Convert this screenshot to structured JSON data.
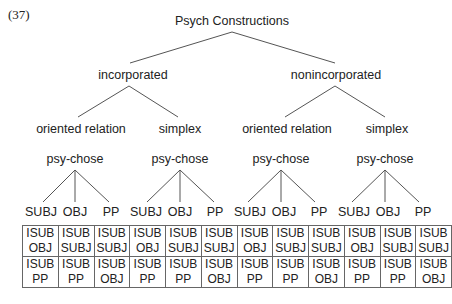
{
  "example_number": "(37)",
  "root": {
    "label": "Psych Constructions"
  },
  "branches": [
    {
      "label": "incorporated",
      "children": [
        {
          "label": "oriented relation",
          "verb": "psy-chose",
          "args": [
            "SUBJ",
            "OBJ",
            "PP"
          ]
        },
        {
          "label": "simplex",
          "verb": "psy-chose",
          "args": [
            "SUBJ",
            "OBJ",
            "PP"
          ]
        }
      ]
    },
    {
      "label": "nonincorporated",
      "children": [
        {
          "label": "oriented relation",
          "verb": "psy-chose",
          "args": [
            "SUBJ",
            "OBJ",
            "PP"
          ]
        },
        {
          "label": "simplex",
          "verb": "psy-chose",
          "args": [
            "SUBJ",
            "OBJ",
            "PP"
          ]
        }
      ]
    }
  ],
  "table": {
    "rows": [
      [
        [
          "ISUB",
          "OBJ"
        ],
        [
          "ISUB",
          "SUBJ"
        ],
        [
          "ISUB",
          "SUBJ"
        ],
        [
          "ISUB",
          "OBJ"
        ],
        [
          "ISUB",
          "SUBJ"
        ],
        [
          "ISUB",
          "SUBJ"
        ],
        [
          "ISUB",
          "OBJ"
        ],
        [
          "ISUB",
          "SUBJ"
        ],
        [
          "ISUB",
          "SUBJ"
        ],
        [
          "ISUB",
          "OBJ"
        ],
        [
          "ISUB",
          "SUBJ"
        ],
        [
          "ISUB",
          "SUBJ"
        ]
      ],
      [
        [
          "ISUB",
          "PP"
        ],
        [
          "ISUB",
          "PP"
        ],
        [
          "ISUB",
          "OBJ"
        ],
        [
          "ISUB",
          "PP"
        ],
        [
          "ISUB",
          "PP"
        ],
        [
          "ISUB",
          "OBJ"
        ],
        [
          "ISUB",
          "PP"
        ],
        [
          "ISUB",
          "PP"
        ],
        [
          "ISUB",
          "OBJ"
        ],
        [
          "ISUB",
          "PP"
        ],
        [
          "ISUB",
          "PP"
        ],
        [
          "ISUB",
          "OBJ"
        ]
      ]
    ]
  },
  "colors": {
    "line": "#555555",
    "text": "#222222",
    "border": "#666666"
  }
}
